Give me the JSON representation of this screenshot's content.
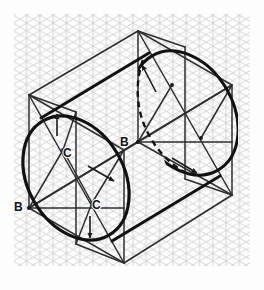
{
  "figure": {
    "paper": {
      "background_color": "#fdfdfd",
      "grid_type": "isometric-triangular",
      "grid_color_light": "#d6d6d8",
      "grid_color_mid": "#c2c2c6",
      "grid_spacing_px": 13.3,
      "grid_area": {
        "x": 14,
        "y": 14,
        "width": 236,
        "height": 252
      }
    },
    "ink": {
      "construction_color": "#2b2b2b",
      "outline_color": "#111111",
      "hidden_color": "#111111",
      "outline_width_px": 3.0,
      "construction_width_px": 1.5,
      "hidden_dash_pattern": "6 4"
    },
    "labels": [
      {
        "id": "label-b-left",
        "text": "B",
        "x": 14,
        "y": 211,
        "anchor": "start"
      },
      {
        "id": "label-b-center",
        "text": "B",
        "x": 120,
        "y": 146,
        "anchor": "start"
      },
      {
        "id": "label-c-upper",
        "text": "C",
        "x": 63,
        "y": 156,
        "anchor": "start"
      },
      {
        "id": "label-c-lower",
        "text": "C",
        "x": 92,
        "y": 208,
        "anchor": "start"
      }
    ],
    "label_font_size_px": 12,
    "geometry": {
      "front_rhombus": {
        "note": "Enclosing rhombus of the near circular face",
        "points": "29,95 124,150 124,263 29,208"
      },
      "back_rhombus": {
        "note": "Enclosing rhombus of the far circular face",
        "points": "138,31 232,85 232,195 138,142"
      },
      "connectors": [
        {
          "id": "top-edge",
          "from": "29,95",
          "to": "138,31"
        },
        {
          "id": "mid-edge",
          "from": "124,150",
          "to": "232,85"
        },
        {
          "id": "bottom-edge",
          "from": "124,263",
          "to": "232,195"
        },
        {
          "id": "left-edge",
          "from": "29,208",
          "to": "138,142"
        }
      ],
      "front_ellipse": {
        "center": "76,178",
        "rx": 48,
        "ry": 66,
        "rotation_deg": -30,
        "style": "solid-heavy"
      },
      "back_ellipse": {
        "center": "185,113",
        "rx": 48,
        "ry": 66,
        "rotation_deg": -30,
        "style": "solid-heavy-partial"
      },
      "tangent_lines": [
        {
          "id": "upper-tangent",
          "from": "42,117",
          "to": "150,52"
        },
        {
          "id": "lower-tangent",
          "from": "111,240",
          "to": "219,175"
        }
      ],
      "four_center_construction": {
        "front": {
          "large_arc_centers": [
            "29,95",
            "124,263"
          ],
          "small_arc_centers": [
            "63,150",
            "92,203"
          ],
          "tangent_points": [
            "76,112",
            "29,208",
            "124,150",
            "76,244"
          ],
          "radius_lines": [
            {
              "from": "29,95",
              "to": "76,112"
            },
            {
              "from": "29,95",
              "to": "29,208"
            },
            {
              "from": "124,263",
              "to": "76,244"
            },
            {
              "from": "124,263",
              "to": "124,150"
            },
            {
              "from": "63,150",
              "to": "29,208"
            },
            {
              "from": "63,150",
              "to": "76,112"
            },
            {
              "from": "92,203",
              "to": "124,150"
            },
            {
              "from": "92,203",
              "to": "76,244"
            }
          ]
        },
        "back": {
          "large_arc_centers": [
            "138,31",
            "232,195"
          ],
          "small_arc_centers": [
            "172,85",
            "201,138"
          ],
          "radius_lines": [
            {
              "from": "138,31",
              "to": "185,47"
            },
            {
              "from": "232,195",
              "to": "185,179"
            },
            {
              "from": "172,85",
              "to": "138,142"
            },
            {
              "from": "172,85",
              "to": "185,47"
            },
            {
              "from": "201,138",
              "to": "232,85"
            },
            {
              "from": "201,138",
              "to": "185,179"
            }
          ]
        }
      },
      "arrows": [
        {
          "id": "arrow-front-upper",
          "from": "57,133",
          "to": "57,114",
          "direction": "up"
        },
        {
          "id": "arrow-front-lower",
          "from": "90,218",
          "to": "90,235",
          "direction": "down"
        },
        {
          "id": "arrow-front-right",
          "from": "93,170",
          "to": "113,180",
          "direction": "down-right"
        },
        {
          "id": "arrow-back-upper",
          "from": "152,85",
          "to": "142,66",
          "direction": "up-left"
        },
        {
          "id": "arrow-back-lower",
          "from": "175,160",
          "to": "196,172",
          "direction": "down-right"
        }
      ],
      "hidden_lines": [
        {
          "id": "hidden-arc-back-left",
          "path": "M 141,62 C 134,84 136,110 146,130 C 154,148 168,163 186,173"
        }
      ]
    }
  }
}
